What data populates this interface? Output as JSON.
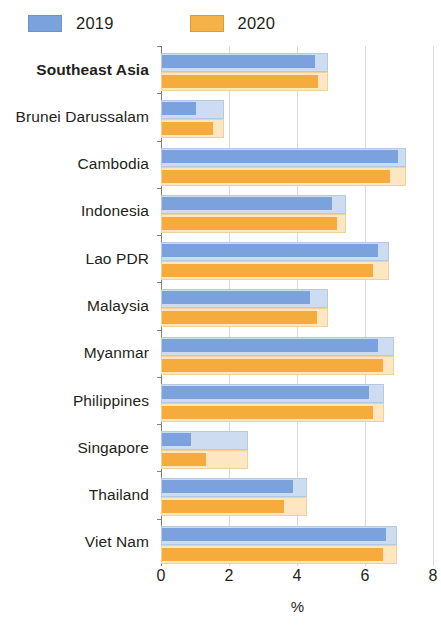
{
  "legend": {
    "entries": [
      {
        "label": "2019",
        "color": "#7ba2dd",
        "key": "blue"
      },
      {
        "label": "2020",
        "color": "#f5ac3c",
        "key": "orange"
      }
    ]
  },
  "axis": {
    "ticks": [
      "0",
      "2",
      "4",
      "6",
      "8"
    ],
    "title": "%"
  },
  "chart_data": {
    "type": "bar",
    "orientation": "horizontal",
    "title": "",
    "subtitle": "",
    "xlabel": "%",
    "ylabel": "",
    "xlim": [
      0,
      8
    ],
    "xticks": [
      0,
      2,
      4,
      6,
      8
    ],
    "grid": true,
    "legend_position": "top-left",
    "categories": [
      "Southeast Asia",
      "Brunei Darussalam",
      "Cambodia",
      "Indonesia",
      "Lao PDR",
      "Malaysia",
      "Myanmar",
      "Philippines",
      "Singapore",
      "Thailand",
      "Viet Nam"
    ],
    "highlighted_categories": [
      "Southeast Asia"
    ],
    "series": [
      {
        "name": "2019",
        "color": "#7ba2dd",
        "values": [
          4.5,
          1.0,
          6.95,
          5.0,
          6.35,
          4.35,
          6.35,
          6.1,
          0.85,
          3.85,
          6.6
        ]
      },
      {
        "name": "2020",
        "color": "#f5ac3c",
        "values": [
          4.6,
          1.5,
          6.7,
          5.15,
          6.2,
          4.55,
          6.5,
          6.2,
          1.3,
          3.6,
          6.5
        ]
      }
    ],
    "shadow_extents": {
      "note": "light backing rectangle drawn behind each bar pair",
      "values": [
        4.9,
        1.85,
        7.2,
        5.45,
        6.7,
        4.9,
        6.85,
        6.55,
        2.55,
        4.3,
        6.95
      ]
    }
  }
}
